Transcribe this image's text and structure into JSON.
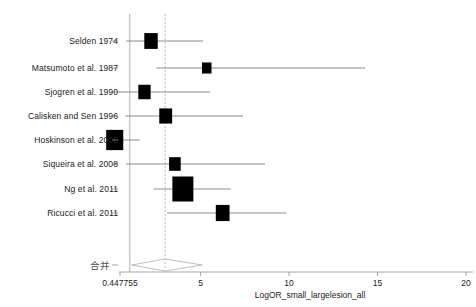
{
  "chart_data": {
    "type": "forest",
    "title": "",
    "xlabel": "LogOR_small_largelesion_all",
    "ylabel": "",
    "xlim": [
      0.447755,
      21.0
    ],
    "tick_values": [
      0.447755,
      5,
      10,
      15,
      20
    ],
    "tick_labels": [
      "0.447755",
      "5",
      "10",
      "15",
      "20"
    ],
    "grid": false,
    "legend": "none",
    "null_line_value": 1.0,
    "pooled_line_value": 3.0,
    "categories": [
      "Selden 1974",
      "Matsumoto et al. 1987",
      "Sjogren et al. 1990",
      "Calisken and Sen 1996",
      "Hoskinson et al. 2002",
      "Siqueira et al. 2008",
      "Ng et al. 2011",
      "Ricucci et al. 2011"
    ],
    "studies": [
      {
        "label": "Selden 1974",
        "estimate": 2.2,
        "ci_low": 0.8,
        "ci_high": 5.15,
        "weight": 0.46
      },
      {
        "label": "Matsumoto et al. 1987",
        "estimate": 5.35,
        "ci_low": 2.52,
        "ci_high": 14.3,
        "weight": 0.18
      },
      {
        "label": "Sjogren et al. 1990",
        "estimate": 1.83,
        "ci_low": 0.28,
        "ci_high": 5.55,
        "weight": 0.38
      },
      {
        "label": "Calisken and Sen 1996",
        "estimate": 3.03,
        "ci_low": 0.75,
        "ci_high": 7.4,
        "weight": 0.42
      },
      {
        "label": "Hoskinson et al. 2002",
        "estimate": 0.15,
        "ci_low": 0.0,
        "ci_high": 1.55,
        "weight": 0.72
      },
      {
        "label": "Siqueira et al. 2008",
        "estimate": 3.55,
        "ci_low": 0.8,
        "ci_high": 8.65,
        "weight": 0.33
      },
      {
        "label": "Ng et al. 2011",
        "estimate": 4.0,
        "ci_low": 2.35,
        "ci_high": 6.7,
        "weight": 1.0
      },
      {
        "label": "Ricucci et al. 2011",
        "estimate": 6.25,
        "ci_low": 3.1,
        "ci_high": 9.85,
        "weight": 0.48
      }
    ],
    "pooled": {
      "label": "合并",
      "estimate": 3.0,
      "ci_low": 1.1,
      "ci_high": 5.1
    },
    "colors": {
      "marker": "#000000",
      "ci_line": "#808080",
      "axis": "#9a9a9a",
      "null_line": "#b0b0b0",
      "pooled_line": "#b8b8b8",
      "diamond": "#c0c0c0",
      "background": "#ffffff",
      "text": "#222222"
    }
  }
}
